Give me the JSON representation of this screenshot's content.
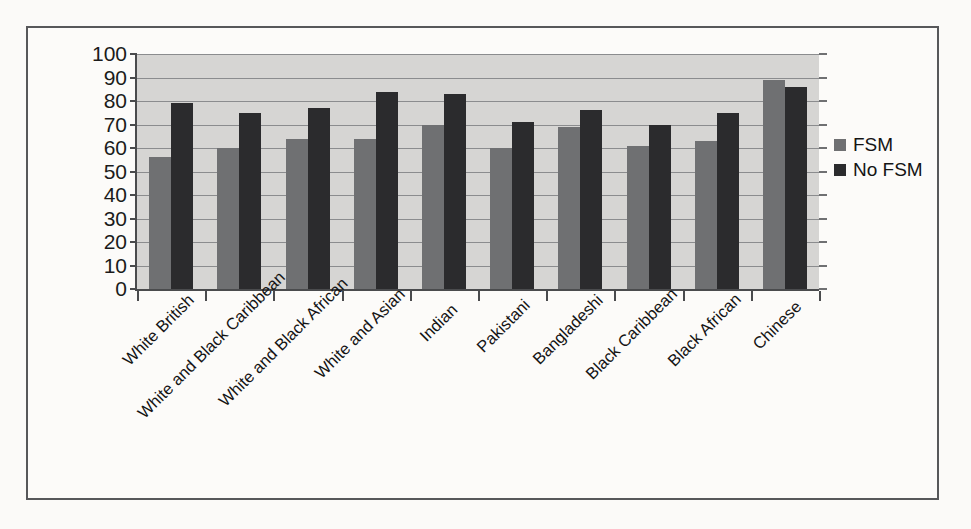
{
  "figure": {
    "background_color": "#fbfaf8",
    "frame_border_color": "#57585a"
  },
  "legend": {
    "position": "right",
    "items": [
      {
        "label": "FSM",
        "color": "#6f7072",
        "swatch_name": "legend-swatch-fsm"
      },
      {
        "label": "No FSM",
        "color": "#2b2b2d",
        "swatch_name": "legend-swatch-no-fsm"
      }
    ]
  },
  "chart_data": {
    "type": "bar",
    "title": "",
    "xlabel": "",
    "ylabel": "",
    "ylim": [
      0,
      100
    ],
    "yticks": [
      0,
      10,
      20,
      30,
      40,
      50,
      60,
      70,
      80,
      90,
      100
    ],
    "ytick_labels": [
      "0",
      "10",
      "20",
      "30",
      "40",
      "50",
      "60",
      "70",
      "80",
      "90",
      "100"
    ],
    "grid": true,
    "plot_background": "#d6d5d3",
    "legend_position": "right",
    "categories": [
      "White British",
      "White and Black Caribbean",
      "White and Black African",
      "White and Asian",
      "Indian",
      "Pakistani",
      "Bangladeshi",
      "Black Caribbean",
      "Black African",
      "Chinese"
    ],
    "series": [
      {
        "name": "FSM",
        "color": "#6f7072",
        "values": [
          56,
          60,
          64,
          64,
          70,
          60,
          69,
          61,
          63,
          89
        ]
      },
      {
        "name": "No FSM",
        "color": "#2b2b2d",
        "values": [
          79,
          75,
          77,
          84,
          83,
          71,
          76,
          70,
          75,
          86
        ]
      }
    ]
  }
}
